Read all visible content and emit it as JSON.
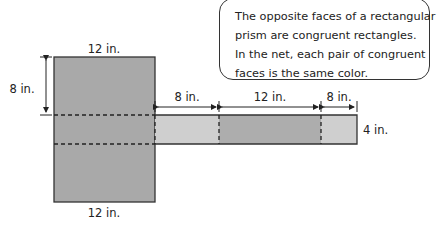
{
  "callout": {
    "lines": [
      "The opposite faces of a rectangular",
      "prism are congruent rectangles.",
      "In the net, each pair of congruent",
      "faces is the same color."
    ]
  },
  "dimensions": {
    "top_width": "12 in.",
    "bottom_width": "12 in.",
    "left_height": "8 in.",
    "strip_seg1": "8 in.",
    "strip_seg2": "12 in.",
    "strip_seg3": "8 in.",
    "strip_height": "4 in."
  },
  "colors": {
    "dark_face": "#a9a9a9",
    "light_face": "#cfcfcf",
    "outline": "#333333"
  }
}
